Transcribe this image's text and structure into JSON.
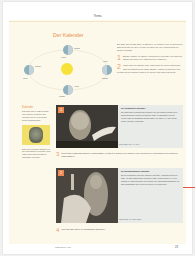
{
  "header": {
    "section": "Thema"
  },
  "title": "Der Kalender",
  "diagram": {
    "labels": [
      "Frühling",
      "Sommer",
      "Herbst",
      "Winter",
      "Sonne"
    ],
    "earth_count": 4
  },
  "intro_text": "Ein Jahr dauert 365 Tage, 5 Stunden, 48 Minuten und 46 Sekunden. Das ist genau die Zeit, welche die Erde für eine Umrundung der Sonne benötigt.",
  "tasks": [
    {
      "number": "1",
      "text": "Erkläre mithilfe der Bilder, wodurch der Wechsel von Tag und Nacht und woher die Jahreszeiten entstehen."
    },
    {
      "number": "2",
      "text": "Wann sind die Nächte lang, wann sind sie kurz? Wann sind Tag und Nacht gleich lang? Erkläre, warum im Sommer am Polarkreis an manchen Tagen die Sonne gar nicht untergeht."
    },
    {
      "number": "3",
      "text": "Mit welchen Jahresbruchteilen (Jahreslänge) rechneten Julianer die Römer? Wie groß war der Unterschied zur genauen Jahreslänge?"
    },
    {
      "number": "4",
      "text": "War das Jahr 2000 ein Schaltjahr? Begründe."
    }
  ],
  "sidebar": {
    "heading": "Kalender",
    "text1": "Das Jahr wird in zwölf Monate und Wochen eingeteilt. Ein Kalender ist ein Verzeichnis dieser Zeitabschnitte.",
    "text2": "Das Wort Kalender stammt von den lateinischen Kalendae, dem ersten Tag eines Monats im römischen Kalender."
  },
  "blocks": [
    {
      "badge": "1",
      "heading": "Der julianische Kalender",
      "text": "Die bisherigen Mondkalender wurden von den Römern durch einen Sonnenkalender ersetzt. Er galt drei Jahre zu 365 Tagen und im vierten Jahr ein Schaltjahr mit 366 Tagen. Im Jahr 46 v. Chr. wurde dieser Kalender eingeführt.",
      "caption": "Julius Cäsar (100–44 v. Chr.)"
    },
    {
      "badge": "2",
      "heading": "Der gregorianische Kalender",
      "text": "Da der julianische Kalender etwas zu lang war, verschoben sich die Tage. Im Jahr 1582 fehlten bereits 10 Tage. Papst Gregor XIII. ließ deshalb 10 Tage streichen und ordnete an, dass Jahrhundertjahre nur dann Schaltjahre sind, wenn sie durch 400 teilbar sind.",
      "caption": "Papst Gregor XIII. (1502–1585)"
    }
  ],
  "footer": {
    "text": "Mathematik im Alltag",
    "page_number": "23"
  },
  "colors": {
    "accent": "#e8904e",
    "background": "#fdf9ea",
    "infobox": "#e9ebe9",
    "sun": "#f7e23a"
  }
}
